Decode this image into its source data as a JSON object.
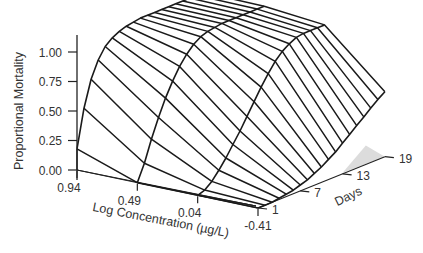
{
  "chart_data": {
    "type": "surface3d",
    "title": "",
    "zlabel": "Proportional Mortality",
    "xlabel": "Log Concentration (µg/L)",
    "ylabel": "Days",
    "z_ticks": [
      "1.00",
      "0.75",
      "0.50",
      "0.25",
      "0.00"
    ],
    "z_tick_values": [
      1.0,
      0.75,
      0.5,
      0.25,
      0.0
    ],
    "x_ticks": [
      "0.94",
      "0.49",
      "0.04",
      "-0.41"
    ],
    "x_tick_values": [
      0.94,
      0.49,
      0.04,
      -0.41
    ],
    "y_ticks": [
      "1",
      "7",
      "13",
      "19"
    ],
    "y_tick_values": [
      1,
      7,
      13,
      19
    ],
    "zlim": [
      0,
      1.1
    ],
    "grid": false,
    "days": [
      1,
      2,
      3,
      4,
      5,
      6,
      7,
      8,
      9,
      10,
      11,
      12,
      13,
      14,
      15,
      16,
      17,
      18,
      19
    ],
    "concentrations": [
      0.94,
      0.49,
      0.04,
      -0.41
    ],
    "series": [
      {
        "name": "0.94",
        "values": [
          0.18,
          0.5,
          0.72,
          0.86,
          0.95,
          1.0,
          1.03,
          1.05,
          1.06,
          1.07,
          1.07,
          1.07,
          1.07,
          1.07,
          1.07,
          1.07,
          1.07,
          1.07,
          1.07
        ]
      },
      {
        "name": "0.49",
        "values": [
          0.0,
          0.14,
          0.32,
          0.48,
          0.62,
          0.74,
          0.84,
          0.92,
          0.98,
          1.02,
          1.04,
          1.05,
          1.06,
          1.06,
          1.06,
          1.06,
          1.06,
          1.06,
          1.06
        ]
      },
      {
        "name": "0.04",
        "values": [
          0.0,
          0.02,
          0.07,
          0.14,
          0.22,
          0.31,
          0.4,
          0.5,
          0.6,
          0.7,
          0.79,
          0.87,
          0.93,
          0.97,
          1.0,
          1.01,
          1.01,
          1.01,
          1.01
        ]
      },
      {
        "name": "-0.41",
        "values": [
          0.0,
          0.0,
          0.0,
          0.01,
          0.02,
          0.03,
          0.05,
          0.07,
          0.1,
          0.13,
          0.17,
          0.21,
          0.26,
          0.31,
          0.36,
          0.41,
          0.46,
          0.51,
          0.55
        ]
      }
    ]
  },
  "axes": {
    "z_title": "Proportional Mortality",
    "x_title": "Log Concentration (µg/L)",
    "y_title": "Days"
  }
}
